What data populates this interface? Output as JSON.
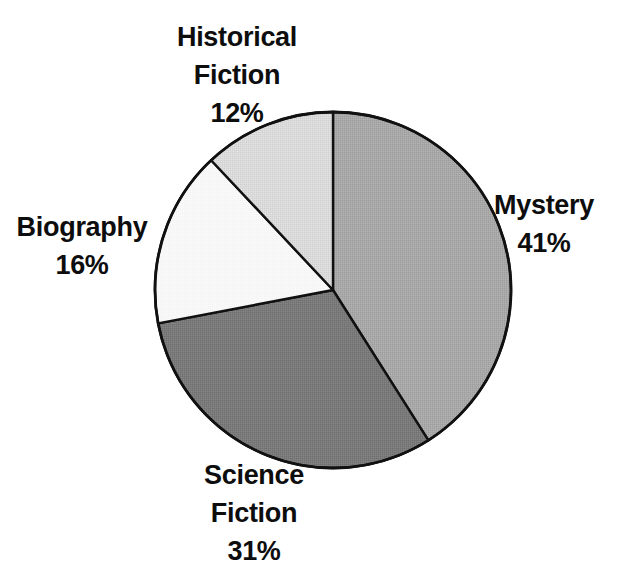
{
  "chart_data": {
    "type": "pie",
    "title": "",
    "subtitle": "",
    "xlabel": "",
    "ylabel": "",
    "legend_position": "none",
    "grid": false,
    "labels_outside": true,
    "start_angle_deg": 0,
    "direction": "clockwise",
    "categories": [
      "Mystery",
      "Science Fiction",
      "Biography",
      "Historical Fiction"
    ],
    "values": [
      41,
      31,
      16,
      12
    ],
    "value_unit": "%",
    "slices": [
      {
        "name": "Mystery",
        "label_lines": [
          "Mystery"
        ],
        "value": 41,
        "value_text": "41%",
        "color": "#a8a8a8",
        "start_pct": 0,
        "end_pct": 41
      },
      {
        "name": "Science Fiction",
        "label_lines": [
          "Science",
          "Fiction"
        ],
        "value": 31,
        "value_text": "31%",
        "color": "#7a7a7a",
        "start_pct": 41,
        "end_pct": 72
      },
      {
        "name": "Biography",
        "label_lines": [
          "Biography"
        ],
        "value": 16,
        "value_text": "16%",
        "color": "#f7f7f7",
        "start_pct": 72,
        "end_pct": 88
      },
      {
        "name": "Historical Fiction",
        "label_lines": [
          "Historical",
          "Fiction"
        ],
        "value": 12,
        "value_text": "12%",
        "color": "#d8d8d8",
        "start_pct": 88,
        "end_pct": 100
      }
    ]
  },
  "labels": {
    "historical_fiction": {
      "line1": "Historical",
      "line2": "Fiction",
      "value": "12%"
    },
    "biography": {
      "line1": "Biography",
      "value": "16%"
    },
    "mystery": {
      "line1": "Mystery",
      "value": "41%"
    },
    "science_fiction": {
      "line1": "Science",
      "line2": "Fiction",
      "value": "31%"
    }
  },
  "style": {
    "background": "#ffffff",
    "outline": "#111111",
    "text_color": "#0d0d0d"
  }
}
